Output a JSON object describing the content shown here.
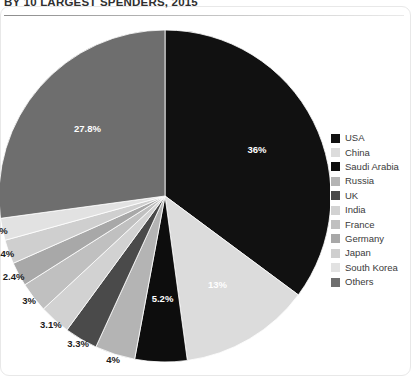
{
  "chart_title": "BY 10 LARGEST SPENDERS, 2015",
  "chart_data": {
    "type": "pie",
    "title": "BY 10 LARGEST SPENDERS, 2015",
    "xlabel": "",
    "ylabel": "",
    "legend_position": "right",
    "grid": false,
    "start_angle_deg": 0,
    "direction": "clockwise",
    "categories": [
      "USA",
      "China",
      "Saudi Arabia",
      "Russia",
      "UK",
      "India",
      "France",
      "Germany",
      "Japan",
      "South Korea",
      "Others"
    ],
    "values": [
      36,
      13,
      5.2,
      4,
      3.3,
      3.1,
      3,
      2.4,
      2.4,
      2.2,
      27.8
    ],
    "labels": [
      "36%",
      "13%",
      "5.2%",
      "4%",
      "3.3%",
      "3.1%",
      "3%",
      "2.4%",
      "2.4%",
      "2.2%",
      "27.8%"
    ],
    "colors": [
      "#111111",
      "#dcdcdc",
      "#0d0d0d",
      "#b4b4b4",
      "#4a4a4a",
      "#d2d2d2",
      "#c0c0c0",
      "#a8a8a8",
      "#cfcfcf",
      "#e2e2e2",
      "#6e6e6e"
    ],
    "label_text_colors": [
      "#ffffff",
      "#1b1b1b",
      "#ffffff",
      "#1b1b1b",
      "#ffffff",
      "#1b1b1b",
      "#1b1b1b",
      "#1b1b1b",
      "#1b1b1b",
      "#1b1b1b",
      "#ffffff"
    ],
    "label_inside": [
      true,
      true,
      true,
      false,
      false,
      false,
      false,
      false,
      false,
      false,
      true
    ]
  },
  "legend": {
    "items": [
      {
        "label": "USA",
        "color": "#111111"
      },
      {
        "label": "China",
        "color": "#dcdcdc"
      },
      {
        "label": "Saudi Arabia",
        "color": "#0d0d0d"
      },
      {
        "label": "Russia",
        "color": "#b4b4b4"
      },
      {
        "label": "UK",
        "color": "#4a4a4a"
      },
      {
        "label": "India",
        "color": "#d2d2d2"
      },
      {
        "label": "France",
        "color": "#c0c0c0"
      },
      {
        "label": "Germany",
        "color": "#a8a8a8"
      },
      {
        "label": "Japan",
        "color": "#cfcfcf"
      },
      {
        "label": "South Korea",
        "color": "#e2e2e2"
      },
      {
        "label": "Others",
        "color": "#6e6e6e"
      }
    ]
  }
}
